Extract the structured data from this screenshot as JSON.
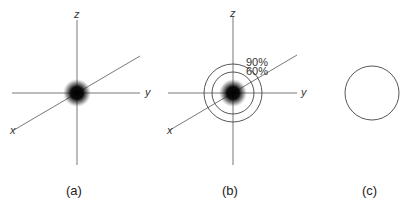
{
  "panels": [
    {
      "id": "a",
      "caption": "(a)",
      "axes": {
        "z": "z",
        "y": "y",
        "x": "x"
      }
    },
    {
      "id": "b",
      "caption": "(b)",
      "axes": {
        "z": "z",
        "y": "y",
        "x": "x"
      },
      "contours": [
        {
          "label": "90%"
        },
        {
          "label": "60%"
        }
      ]
    },
    {
      "id": "c",
      "caption": "(c)"
    }
  ],
  "colors": {
    "axis": "#555555",
    "cloud": "#000000",
    "background": "#ffffff"
  }
}
